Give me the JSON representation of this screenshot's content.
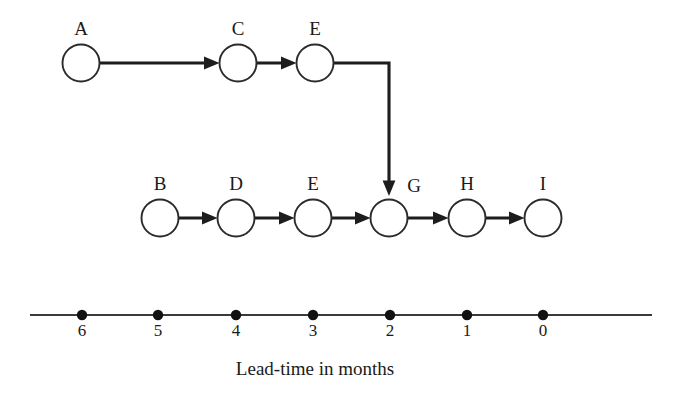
{
  "diagram": {
    "type": "network-precedence-diagram",
    "background_color": "#ffffff",
    "line_color": "#1d1d1d",
    "node_fill": "#ffffff",
    "node_stroke": "#2b2b2b",
    "nodes": [
      {
        "id": "A",
        "label": "A",
        "cx": 81,
        "cy": 63,
        "r": 18.5,
        "label_x": 81,
        "label_y": 35,
        "row": "top"
      },
      {
        "id": "C",
        "label": "C",
        "cx": 238,
        "cy": 63,
        "r": 18.5,
        "label_x": 238,
        "label_y": 35,
        "row": "top"
      },
      {
        "id": "E1",
        "label": "E",
        "cx": 315,
        "cy": 63,
        "r": 18.5,
        "label_x": 315,
        "label_y": 35,
        "row": "top"
      },
      {
        "id": "B",
        "label": "B",
        "cx": 160,
        "cy": 218,
        "r": 18.5,
        "label_x": 160,
        "label_y": 190,
        "row": "bottom"
      },
      {
        "id": "D",
        "label": "D",
        "cx": 236,
        "cy": 218,
        "r": 18.5,
        "label_x": 236,
        "label_y": 190,
        "row": "bottom"
      },
      {
        "id": "E2",
        "label": "E",
        "cx": 313,
        "cy": 218,
        "r": 18.5,
        "label_x": 313,
        "label_y": 190,
        "row": "bottom"
      },
      {
        "id": "G",
        "label": "G",
        "cx": 389,
        "cy": 218,
        "r": 18.5,
        "label_x": 414,
        "label_y": 192,
        "row": "bottom"
      },
      {
        "id": "H",
        "label": "H",
        "cx": 467,
        "cy": 218,
        "r": 18.5,
        "label_x": 467,
        "label_y": 190,
        "row": "bottom"
      },
      {
        "id": "I",
        "label": "I",
        "cx": 543,
        "cy": 218,
        "r": 18.5,
        "label_x": 543,
        "label_y": 190,
        "row": "bottom"
      }
    ],
    "edges": [
      {
        "from": "A",
        "to": "C",
        "kind": "straight-horizontal"
      },
      {
        "from": "C",
        "to": "E1",
        "kind": "straight-horizontal"
      },
      {
        "from": "E1",
        "to": "G",
        "kind": "elbow-right-then-down"
      },
      {
        "from": "B",
        "to": "D",
        "kind": "straight-horizontal"
      },
      {
        "from": "D",
        "to": "E2",
        "kind": "straight-horizontal"
      },
      {
        "from": "E2",
        "to": "G",
        "kind": "straight-horizontal"
      },
      {
        "from": "G",
        "to": "H",
        "kind": "straight-horizontal"
      },
      {
        "from": "H",
        "to": "I",
        "kind": "straight-horizontal"
      }
    ]
  },
  "axis": {
    "caption": "Lead-time in months",
    "caption_x": 315,
    "caption_y": 375,
    "line_y": 315,
    "line_x_start": 30,
    "line_x_end": 652,
    "tick_labels": [
      "6",
      "5",
      "4",
      "3",
      "2",
      "1",
      "0"
    ],
    "tick_positions": [
      82,
      158,
      236,
      313,
      390,
      467,
      543
    ],
    "tick_label_y": 336,
    "dot_radius": 5.2
  }
}
